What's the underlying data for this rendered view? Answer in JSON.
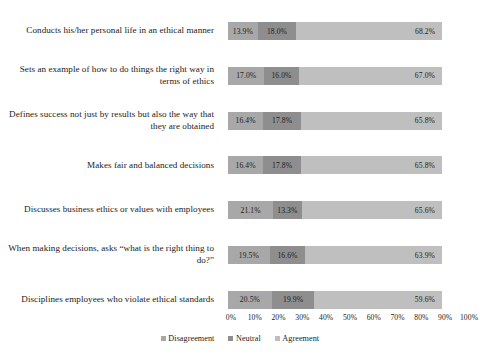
{
  "chart_data": {
    "type": "bar",
    "title": "",
    "subtitle": "",
    "xlabel": "",
    "ylabel": "",
    "orientation": "horizontal",
    "stacked": true,
    "stack_mode": "100%",
    "grid": false,
    "legend_position": "bottom",
    "xlim": [
      0,
      100
    ],
    "xticks": [
      "0%",
      "10%",
      "20%",
      "30%",
      "40%",
      "50%",
      "60%",
      "70%",
      "80%",
      "90%",
      "100%"
    ],
    "xtick_values": [
      0,
      10,
      20,
      30,
      40,
      50,
      60,
      70,
      80,
      90,
      100
    ],
    "categories": [
      "Conducts his/her personal life in an ethical manner",
      "Sets an example of how to do things the right way in terms of ethics",
      "Defines success not just by results but also the way that they are obtained",
      "Makes fair and balanced decisions",
      "Discusses business ethics or values with employees",
      "When making decisions, asks “what is the right thing to do?”",
      "Disciplines employees who violate ethical standards"
    ],
    "series": [
      {
        "name": "Disagreement",
        "color": "#a8a8a8",
        "values": [
          13.9,
          17.0,
          16.4,
          16.4,
          21.1,
          19.5,
          20.5
        ],
        "labels": [
          "13.9%",
          "17.0%",
          "16.4%",
          "16.4%",
          "21.1%",
          "19.5%",
          "20.5%"
        ]
      },
      {
        "name": "Neutral",
        "color": "#8e8e8e",
        "values": [
          18.0,
          16.0,
          17.8,
          17.8,
          13.3,
          16.6,
          19.9
        ],
        "labels": [
          "18.0%",
          "16.0%",
          "17.8%",
          "17.8%",
          "13.3%",
          "16.6%",
          "19.9%"
        ]
      },
      {
        "name": "Agreement",
        "color": "#bfbfbf",
        "values": [
          68.2,
          67.0,
          65.8,
          65.8,
          65.6,
          63.9,
          59.6
        ],
        "labels": [
          "68.2%",
          "67.0%",
          "65.8%",
          "65.8%",
          "65.6%",
          "63.9%",
          "59.6%"
        ]
      }
    ]
  }
}
